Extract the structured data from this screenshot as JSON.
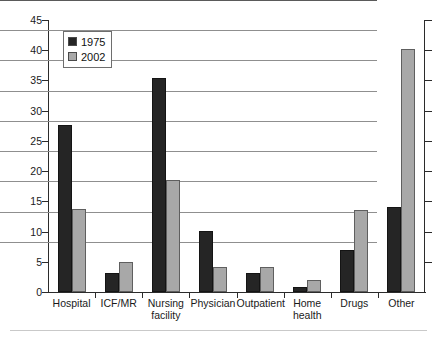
{
  "chart_data": {
    "type": "bar",
    "title": "",
    "xlabel": "",
    "ylabel": "Percent",
    "ylim": [
      0,
      45
    ],
    "ytick_step": 5,
    "yticks": [
      "0",
      "5",
      "10",
      "15",
      "20",
      "25",
      "30",
      "35",
      "40",
      "45"
    ],
    "grid": true,
    "legend_position": "top-left",
    "categories": [
      "Hospital",
      "ICF/MR",
      "Nursing\nfacility",
      "Physician",
      "Outpatient",
      "Home\nhealth",
      "Drugs",
      "Other"
    ],
    "series": [
      {
        "name": "1975",
        "color": "#252525",
        "values": [
          27.7,
          3.1,
          35.4,
          10.1,
          3.1,
          0.8,
          6.9,
          14.1
        ]
      },
      {
        "name": "2002",
        "color": "#a8a8a8",
        "values": [
          13.7,
          5.0,
          18.5,
          4.1,
          4.2,
          2.0,
          13.5,
          40.2
        ]
      }
    ]
  },
  "legend": {
    "entries": [
      {
        "label": "1975",
        "swatch": "black-square-swatch"
      },
      {
        "label": "2002",
        "swatch": "gray-square-swatch"
      }
    ]
  },
  "axis": {
    "y_title": "Percent"
  }
}
